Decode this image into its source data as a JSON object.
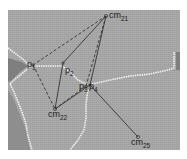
{
  "diagram": {
    "type": "voronoi-like region map with centroid/point connections",
    "colors": {
      "background_region": "#a6a6a6",
      "dark_region": "#7d7d7d",
      "boundary": "#f0f0f0",
      "line": "#3a3a3a"
    },
    "nodes": [
      {
        "id": "cm21",
        "base": "cm",
        "sub": "21",
        "x": 106,
        "y": 16
      },
      {
        "id": "p1",
        "base": "p",
        "sub": "1",
        "x": 33,
        "y": 65
      },
      {
        "id": "p2",
        "base": "p",
        "sub": "2",
        "x": 63,
        "y": 63
      },
      {
        "id": "p3",
        "base": "p",
        "sub": "3",
        "x": 86,
        "y": 86
      },
      {
        "id": "p4",
        "base": "p",
        "sub": "4",
        "x": 90,
        "y": 85
      },
      {
        "id": "cm22",
        "base": "cm",
        "sub": "22",
        "x": 55,
        "y": 109
      },
      {
        "id": "cm25",
        "base": "cm",
        "sub": "25",
        "x": 138,
        "y": 137
      }
    ],
    "edges_solid": [
      [
        "cm21",
        "p2"
      ],
      [
        "p2",
        "cm22"
      ],
      [
        "cm21",
        "p4"
      ],
      [
        "cm22",
        "p4"
      ],
      [
        "p4",
        "cm25"
      ]
    ],
    "edges_dashed": [
      [
        "cm21",
        "p1"
      ],
      [
        "p1",
        "cm22"
      ],
      [
        "cm21",
        "p3"
      ],
      [
        "cm22",
        "p3"
      ]
    ]
  }
}
